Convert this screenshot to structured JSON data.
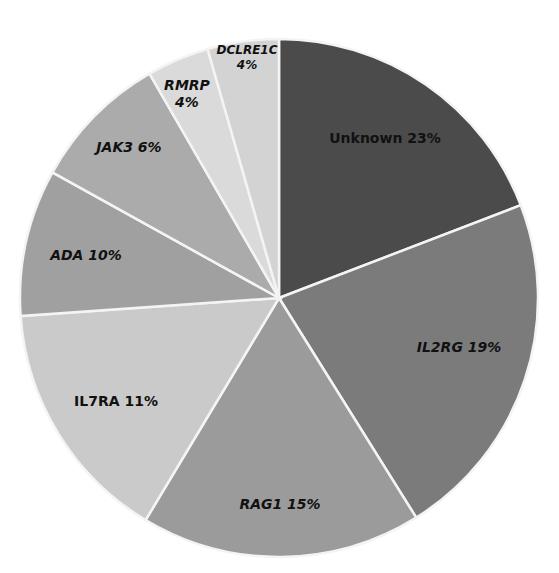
{
  "chart_data": {
    "type": "pie",
    "title": "",
    "start_angle_deg": 0,
    "direction": "clockwise",
    "categories": [
      "Unknown",
      "IL2RG",
      "RAG1",
      "IL7RA",
      "ADA",
      "JAK3",
      "RMRP",
      "DCLRE1C"
    ],
    "values": [
      23,
      19,
      15,
      11,
      10,
      6,
      4,
      4
    ],
    "values_note": "Percentages as printed on the slice labels; they sum to 92, not 100.",
    "unit": "%",
    "colors": [
      "#4b4b4b",
      "#7b7b7b",
      "#9b9b9b",
      "#cacaca",
      "#a0a0a0",
      "#ababab",
      "#dadada",
      "#d3d3d3"
    ],
    "drawn_boundary_angles_deg": [
      0,
      69,
      148,
      211,
      266,
      299,
      330,
      344,
      360
    ],
    "drawn_boundary_note": "Approximate slice edges measured from the image; used only for rendering geometry.",
    "labels": [
      {
        "text": "Unknown 23%",
        "lines": [
          "Unknown 23%"
        ],
        "italic": false,
        "small": false,
        "x": 385,
        "y": 139
      },
      {
        "text": "IL2RG 19%",
        "lines": [
          "IL2RG 19%"
        ],
        "italic": true,
        "small": false,
        "x": 459,
        "y": 348
      },
      {
        "text": "RAG1 15%",
        "lines": [
          "RAG1 15%"
        ],
        "italic": true,
        "small": false,
        "x": 280,
        "y": 505
      },
      {
        "text": "IL7RA 11%",
        "lines": [
          "IL7RA 11%"
        ],
        "italic": false,
        "small": false,
        "x": 116,
        "y": 402
      },
      {
        "text": "ADA 10%",
        "lines": [
          "ADA 10%"
        ],
        "italic": true,
        "small": false,
        "x": 86,
        "y": 256
      },
      {
        "text": "JAK3 6%",
        "lines": [
          "JAK3 6%"
        ],
        "italic": true,
        "small": false,
        "x": 129,
        "y": 148
      },
      {
        "text": "RMRP 4%",
        "lines": [
          "RMRP",
          "4%"
        ],
        "italic": true,
        "small": false,
        "x": 187,
        "y": 94
      },
      {
        "text": "DCLRE1C 4%",
        "lines": [
          "DCLRE1C",
          "4%"
        ],
        "italic": true,
        "small": true,
        "x": 247,
        "y": 57
      }
    ],
    "center": [
      279,
      298
    ],
    "radius": 259,
    "legend": "none",
    "grid": false
  }
}
